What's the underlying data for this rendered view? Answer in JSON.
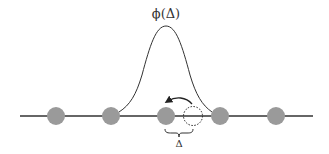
{
  "diagram": {
    "title_label": "ϕ(Δ)",
    "displacement_label": "Δ",
    "colors": {
      "line": "#333333",
      "atom_fill": "#999999",
      "curve": "#333333",
      "dotted_circle": "#333333"
    },
    "atoms": [
      {
        "x": 56,
        "y": 116,
        "r": 9
      },
      {
        "x": 111,
        "y": 116,
        "r": 9
      },
      {
        "x": 166,
        "y": 116,
        "r": 9
      },
      {
        "x": 220,
        "y": 116,
        "r": 9
      },
      {
        "x": 276,
        "y": 116,
        "r": 9
      }
    ],
    "displaced_position": {
      "x": 192,
      "y": 116,
      "r": 9
    },
    "gaussian": {
      "center_x": 166,
      "peak_y": 26,
      "base_y": 112,
      "left_x": 120,
      "right_x": 212
    }
  }
}
